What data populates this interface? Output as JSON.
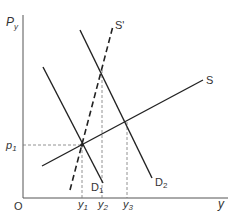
{
  "diagram": {
    "type": "supply-demand",
    "axes": {
      "y_label": "P",
      "y_label_sub": "y",
      "x_label": "y",
      "origin_label": "O"
    },
    "price_labels": [
      {
        "text": "p",
        "sub": "1"
      }
    ],
    "quantity_labels": [
      {
        "text": "y",
        "sub": "1"
      },
      {
        "text": "y",
        "sub": "2"
      },
      {
        "text": "y",
        "sub": "3"
      }
    ],
    "curves": [
      {
        "name": "S",
        "label": "S",
        "style": "solid"
      },
      {
        "name": "S'",
        "label": "S'",
        "style": "dashed"
      },
      {
        "name": "D1",
        "label": "D",
        "sub": "1",
        "style": "solid"
      },
      {
        "name": "D2",
        "label": "D",
        "sub": "2",
        "style": "solid"
      }
    ],
    "colors": {
      "line": "#222222",
      "guide": "#555555",
      "text": "#333333"
    }
  }
}
